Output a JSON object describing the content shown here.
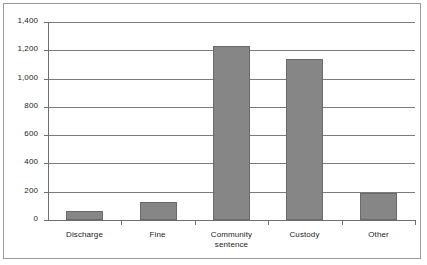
{
  "chart_data": {
    "type": "bar",
    "title": "",
    "subtitle": "",
    "xlabel": "",
    "ylabel": "",
    "categories": [
      "Discharge",
      "Fine",
      "Community sentence",
      "Custody",
      "Other"
    ],
    "category_lines": [
      [
        "Discharge"
      ],
      [
        "Fine"
      ],
      [
        "Community",
        "sentence"
      ],
      [
        "Custody"
      ],
      [
        "Other"
      ]
    ],
    "values": [
      67,
      127,
      1230,
      1138,
      191
    ],
    "ylim": [
      0,
      1400
    ],
    "ytick_step": 200,
    "ytick_values": [
      0,
      200,
      400,
      600,
      800,
      1000,
      1200,
      1400
    ],
    "ytick_labels": [
      "0",
      "200",
      "400",
      "600",
      "800",
      "1,000",
      "1,200",
      "1,400"
    ],
    "grid": true,
    "grid_axis": "y",
    "legend": false,
    "legend_position": "none",
    "series": [
      {
        "name": "",
        "values": [
          67,
          127,
          1230,
          1138,
          191
        ]
      }
    ],
    "colors": {
      "bar_fill": "#868686",
      "bar_border": "#6a6a6a",
      "gridline": "#7b7b7b",
      "axis": "#6e6e6e",
      "frame_border": "#9a9a9a",
      "text": "#1d1d1d",
      "background": "#ffffff"
    }
  }
}
